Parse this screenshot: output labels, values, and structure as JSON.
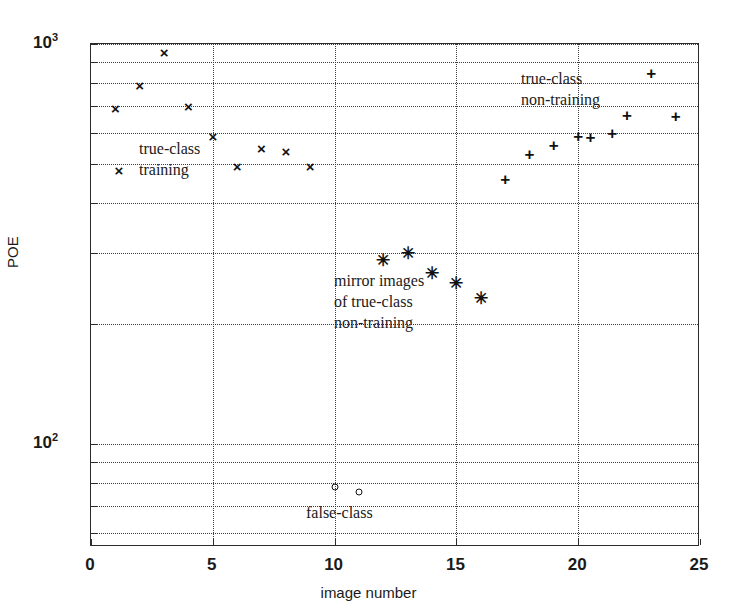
{
  "chart_data": {
    "type": "scatter",
    "title": "",
    "xlabel": "image number",
    "ylabel": "POE",
    "xlim": [
      0,
      25
    ],
    "ylim": [
      55,
      1000
    ],
    "yscale": "log",
    "xscale": "linear",
    "grid": true,
    "xticks": [
      0,
      5,
      10,
      15,
      20,
      25
    ],
    "xtick_labels": [
      "0",
      "5",
      "10",
      "15",
      "20",
      "25"
    ],
    "ytick_labels": [
      "10²",
      "10³"
    ],
    "ytick_values": [
      100,
      1000
    ],
    "y_minor_gridlines": [
      200,
      300,
      400,
      500,
      600,
      700,
      800,
      900,
      60,
      70,
      80,
      90
    ],
    "legend_position": "none",
    "series": [
      {
        "name": "true-class training",
        "marker": "x",
        "points": [
          {
            "x": 1,
            "y": 690
          },
          {
            "x": 2,
            "y": 790
          },
          {
            "x": 3,
            "y": 955
          },
          {
            "x": 4,
            "y": 700
          },
          {
            "x": 5,
            "y": 590
          },
          {
            "x": 6,
            "y": 495
          },
          {
            "x": 7,
            "y": 550
          },
          {
            "x": 8,
            "y": 540
          },
          {
            "x": 9,
            "y": 495
          }
        ]
      },
      {
        "name": "mirror images of true-class non-training",
        "marker": "*",
        "points": [
          {
            "x": 12,
            "y": 288
          },
          {
            "x": 13,
            "y": 300
          },
          {
            "x": 14,
            "y": 268
          },
          {
            "x": 15,
            "y": 253
          },
          {
            "x": 16,
            "y": 232
          }
        ]
      },
      {
        "name": "true-class non-training",
        "marker": "+",
        "points": [
          {
            "x": 17,
            "y": 460
          },
          {
            "x": 18,
            "y": 530
          },
          {
            "x": 19,
            "y": 560
          },
          {
            "x": 20,
            "y": 590
          },
          {
            "x": 20.5,
            "y": 585
          },
          {
            "x": 21.4,
            "y": 600
          },
          {
            "x": 22,
            "y": 665
          },
          {
            "x": 23,
            "y": 845
          },
          {
            "x": 24,
            "y": 660
          }
        ]
      },
      {
        "name": "false-class",
        "marker": "o",
        "points": [
          {
            "x": 10,
            "y": 78
          },
          {
            "x": 11,
            "y": 76
          }
        ]
      }
    ],
    "annotations": [
      {
        "id": "true-class-training",
        "lines": [
          "true-class",
          "training"
        ],
        "marker": "x"
      },
      {
        "id": "true-class-non-training",
        "lines": [
          "true-class",
          "non-training"
        ],
        "marker": "+"
      },
      {
        "id": "mirror-images",
        "lines": [
          "mirror images",
          "of true-class",
          "non-training"
        ],
        "marker": "*"
      },
      {
        "id": "false-class",
        "lines": [
          "false-class"
        ],
        "marker": "o"
      }
    ]
  },
  "axes": {
    "x_title": "image number",
    "y_title": "POE",
    "x_ticks": [
      {
        "label": "0",
        "value": 0
      },
      {
        "label": "5",
        "value": 5
      },
      {
        "label": "10",
        "value": 10
      },
      {
        "label": "15",
        "value": 15
      },
      {
        "label": "20",
        "value": 20
      },
      {
        "label": "25",
        "value": 25
      }
    ],
    "y_ticks": [
      {
        "label_base": "10",
        "label_exp": "3",
        "value": 1000
      },
      {
        "label_base": "10",
        "label_exp": "2",
        "value": 100
      }
    ]
  },
  "annotations": {
    "true_class_training_line1": "true-class",
    "true_class_training_line2": "training",
    "true_class_non_training_line1": "true-class",
    "true_class_non_training_line2": "non-training",
    "mirror_line1": "mirror images",
    "mirror_line2": "of true-class",
    "mirror_line3": "non-training",
    "false_class": "false-class",
    "glyph_x": "×",
    "glyph_plus": "+",
    "glyph_star": "✳",
    "glyph_circle": "o"
  },
  "colors": {
    "frame": "#2b2b2b",
    "grid": "#3a3a3a",
    "marker": "#111111",
    "background": "#ffffff",
    "text": "#1a1a1a"
  }
}
